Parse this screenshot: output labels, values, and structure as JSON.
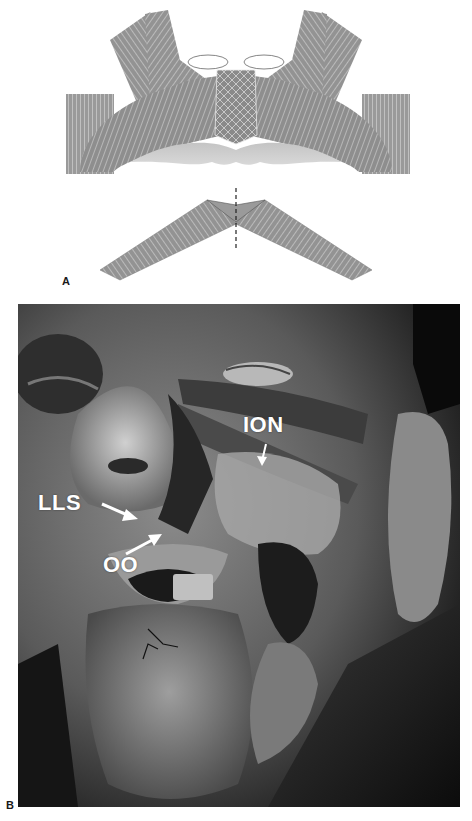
{
  "figure": {
    "panel_a": {
      "label": "A",
      "description": "Illustration of perioral/midface muscles with decussating central fibers; below, a V-shaped muscle schematic with a vertical dashed midline"
    },
    "panel_b": {
      "label": "B",
      "description": "Cadaveric dissection photograph of the face showing labeled structures",
      "annotations": [
        {
          "text": "ION",
          "arrow": "down"
        },
        {
          "text": "LLS",
          "arrow": "right"
        },
        {
          "text": "OO",
          "arrow": "up-right"
        }
      ]
    }
  },
  "colors": {
    "background": "#ffffff",
    "muscle_fill": "#9a9a9a",
    "muscle_line": "#e8e8e8",
    "photo_dark": "#1a1a1a",
    "label_text": "#ffffff"
  }
}
